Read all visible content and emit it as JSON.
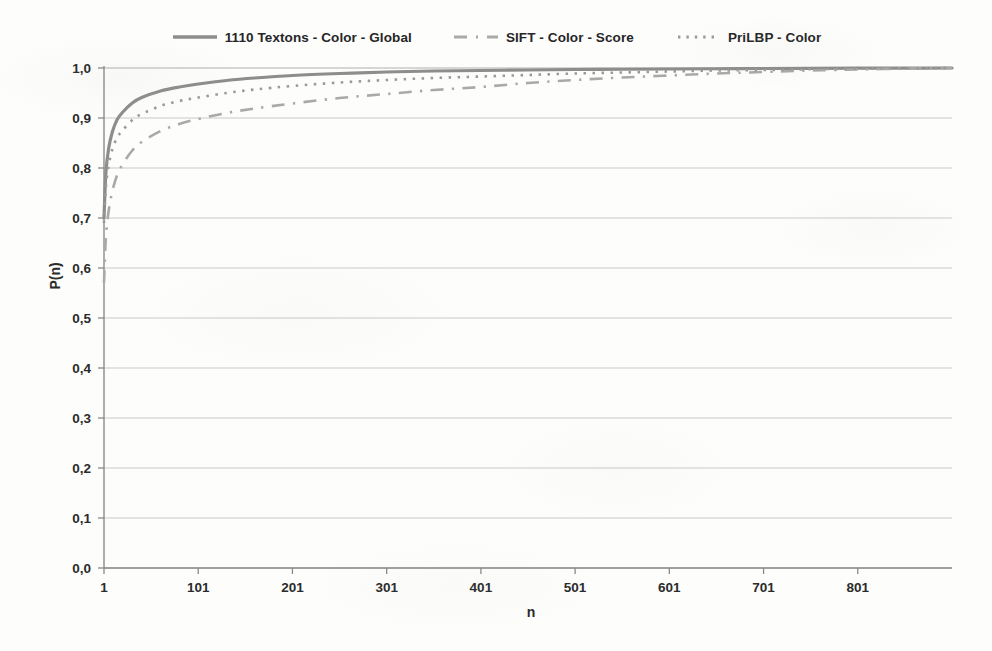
{
  "chart_data": {
    "type": "line",
    "title": "",
    "xlabel": "n",
    "ylabel": "P(n)",
    "xlim": [
      1,
      901
    ],
    "ylim": [
      0.0,
      1.0
    ],
    "grid": true,
    "grid_axis": "y",
    "legend_position": "top-center",
    "xticks": [
      1,
      101,
      201,
      301,
      401,
      501,
      601,
      701,
      801
    ],
    "xtick_labels": [
      "1",
      "101",
      "201",
      "301",
      "401",
      "501",
      "601",
      "701",
      "801"
    ],
    "yticks": [
      0.0,
      0.1,
      0.2,
      0.3,
      0.4,
      0.5,
      0.6,
      0.7,
      0.8,
      0.9,
      1.0
    ],
    "ytick_labels": [
      "0,0",
      "0,1",
      "0,2",
      "0,3",
      "0,4",
      "0,5",
      "0,6",
      "0,7",
      "0,8",
      "0,9",
      "1,0"
    ],
    "decimal_separator": ",",
    "series": [
      {
        "name": "1110  Textons - Color - Global",
        "style": "solid",
        "color": "#8d8d8d",
        "width": 3.2,
        "x": [
          1,
          3,
          6,
          10,
          15,
          21,
          31,
          41,
          61,
          81,
          101,
          131,
          161,
          201,
          251,
          301,
          351,
          401,
          451,
          501,
          551,
          601,
          651,
          701,
          751,
          801,
          851,
          901
        ],
        "y": [
          0.7,
          0.79,
          0.84,
          0.873,
          0.897,
          0.912,
          0.93,
          0.941,
          0.954,
          0.962,
          0.968,
          0.975,
          0.98,
          0.985,
          0.989,
          0.992,
          0.994,
          0.995,
          0.996,
          0.997,
          0.9975,
          0.998,
          0.9985,
          0.999,
          0.9993,
          0.9996,
          0.9998,
          1.0
        ]
      },
      {
        "name": "SIFT - Color - Score",
        "style": "dashdot",
        "color": "#a9a9a9",
        "width": 2.6,
        "x": [
          1,
          3,
          6,
          10,
          15,
          21,
          31,
          41,
          61,
          81,
          101,
          131,
          161,
          201,
          251,
          301,
          351,
          401,
          451,
          501,
          551,
          601,
          651,
          701,
          751,
          801,
          851,
          901
        ],
        "y": [
          0.57,
          0.66,
          0.715,
          0.755,
          0.786,
          0.808,
          0.835,
          0.852,
          0.874,
          0.888,
          0.898,
          0.91,
          0.919,
          0.929,
          0.94,
          0.948,
          0.956,
          0.962,
          0.97,
          0.976,
          0.981,
          0.985,
          0.989,
          0.992,
          0.995,
          0.997,
          0.9988,
          1.0
        ]
      },
      {
        "name": "PriLBP - Color",
        "style": "dotted",
        "color": "#9a9a9a",
        "width": 2.6,
        "x": [
          1,
          3,
          6,
          10,
          15,
          21,
          31,
          41,
          61,
          81,
          101,
          131,
          161,
          201,
          251,
          301,
          351,
          401,
          451,
          501,
          551,
          601,
          651,
          701,
          751,
          801,
          851,
          901
        ],
        "y": [
          0.69,
          0.762,
          0.806,
          0.838,
          0.861,
          0.876,
          0.896,
          0.908,
          0.924,
          0.934,
          0.941,
          0.95,
          0.957,
          0.964,
          0.971,
          0.976,
          0.98,
          0.983,
          0.986,
          0.989,
          0.991,
          0.993,
          0.995,
          0.996,
          0.9975,
          0.9985,
          0.9993,
          1.0
        ]
      }
    ]
  },
  "legend": {
    "items": [
      {
        "label": "1110  Textons - Color - Global",
        "style": "solid",
        "color": "#8d8d8d"
      },
      {
        "label": "SIFT - Color - Score",
        "style": "dashdot",
        "color": "#a9a9a9"
      },
      {
        "label": "PriLBP - Color",
        "style": "dotted",
        "color": "#9a9a9a"
      }
    ]
  },
  "axes": {
    "x_title": "n",
    "y_title": "P(n)"
  },
  "colors": {
    "background": "#fdfdfc",
    "grid": "#c9c9c9",
    "axis": "#8a8a8a",
    "text": "#2b2b2b"
  }
}
